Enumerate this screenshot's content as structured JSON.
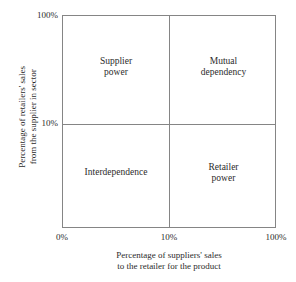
{
  "chart_data": {
    "type": "table",
    "title": "",
    "subtitle": "",
    "xlabel_lines": [
      "Percentage of suppliers' sales",
      "to the retailer for the product"
    ],
    "ylabel_lines": [
      "Percentage of retailers' sales",
      "from the supplier in sector"
    ],
    "x_ticks": [
      "0%",
      "10%",
      "100%"
    ],
    "y_ticks": [
      "100%",
      "10%"
    ],
    "y_origin_tick": "0%",
    "grid": false,
    "legend": "none",
    "matrix": {
      "rows": 2,
      "cols": 2,
      "x_split_label": "10%",
      "y_split_label": "10%",
      "cells": [
        {
          "position": "top-left",
          "x_band": "0% to 10%",
          "y_band": "10% to 100%",
          "lines": [
            "Supplier",
            "power"
          ],
          "text": "Supplier power"
        },
        {
          "position": "top-right",
          "x_band": "10% to 100%",
          "y_band": "10% to 100%",
          "lines": [
            "Mutual",
            "dependency"
          ],
          "text": "Mutual dependency"
        },
        {
          "position": "bottom-left",
          "x_band": "0% to 10%",
          "y_band": "0% to 10%",
          "lines": [
            "Interdependence"
          ],
          "text": "Interdependence"
        },
        {
          "position": "bottom-right",
          "x_band": "10% to 100%",
          "y_band": "0% to 10%",
          "lines": [
            "Retailer",
            "power"
          ],
          "text": "Retailer power"
        }
      ]
    },
    "colors": {
      "line": "#858585",
      "text": "#2b2b2b",
      "background": "#ffffff"
    }
  },
  "quadrants": {
    "top_left": {
      "line1": "Supplier",
      "line2": "power"
    },
    "top_right": {
      "line1": "Mutual",
      "line2": "dependency"
    },
    "bottom_left": {
      "line1": "Interdependence"
    },
    "bottom_right": {
      "line1": "Retailer",
      "line2": "power"
    }
  },
  "axes": {
    "y": {
      "title_line1": "Percentage of retailers' sales",
      "title_line2": "from the supplier in sector",
      "tick_top": "100%",
      "tick_mid": "10%"
    },
    "x": {
      "title_line1": "Percentage of suppliers' sales",
      "title_line2": "to the retailer for the product",
      "tick_left": "0%",
      "tick_mid": "10%",
      "tick_right": "100%"
    }
  }
}
